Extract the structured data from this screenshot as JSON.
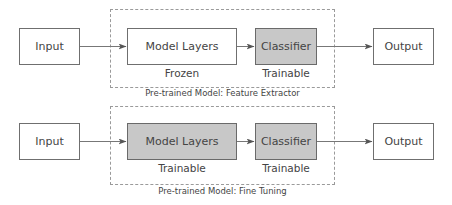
{
  "diagram": {
    "colors": {
      "box_border": "#6f6f6f",
      "shaded_fill": "#c8c8c8",
      "plain_fill": "#ffffff",
      "arrow": "#555555",
      "dashed_border": "#9a9a9a",
      "text": "#444444"
    },
    "rows": [
      {
        "caption": "Pre-trained Model: Feature Extractor",
        "nodes": {
          "input": {
            "label": "Input"
          },
          "model_layers": {
            "label": "Model Layers",
            "sublabel": "Frozen",
            "shaded": false
          },
          "classifier": {
            "label": "Classifier",
            "sublabel": "Trainable",
            "shaded": true
          },
          "output": {
            "label": "Output"
          }
        }
      },
      {
        "caption": "Pre-trained Model: Fine Tuning",
        "nodes": {
          "input": {
            "label": "Input"
          },
          "model_layers": {
            "label": "Model Layers",
            "sublabel": "Trainable",
            "shaded": true
          },
          "classifier": {
            "label": "Classifier",
            "sublabel": "Trainable",
            "shaded": true
          },
          "output": {
            "label": "Output"
          }
        }
      }
    ],
    "edges": [
      {
        "row": 0,
        "from": "Input",
        "to": "Model Layers"
      },
      {
        "row": 0,
        "from": "Model Layers",
        "to": "Classifier"
      },
      {
        "row": 0,
        "from": "Classifier",
        "to": "Output"
      },
      {
        "row": 1,
        "from": "Input",
        "to": "Model Layers"
      },
      {
        "row": 1,
        "from": "Model Layers",
        "to": "Classifier"
      },
      {
        "row": 1,
        "from": "Classifier",
        "to": "Output"
      }
    ]
  }
}
